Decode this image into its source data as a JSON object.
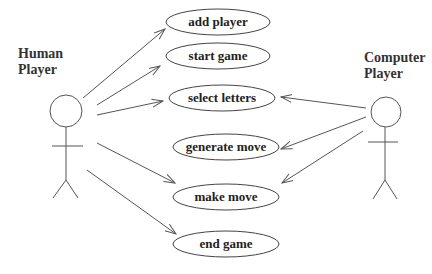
{
  "diagram": {
    "type": "uml-use-case",
    "actors": [
      {
        "id": "human",
        "name_line1": "Human",
        "name_line2": "Player"
      },
      {
        "id": "computer",
        "name_line1": "Computer",
        "name_line2": "Player"
      }
    ],
    "use_cases": [
      {
        "id": "add_player",
        "label": "add player"
      },
      {
        "id": "start_game",
        "label": "start game"
      },
      {
        "id": "select_letters",
        "label": "select letters"
      },
      {
        "id": "generate_move",
        "label": "generate move"
      },
      {
        "id": "make_move",
        "label": "make move"
      },
      {
        "id": "end_game",
        "label": "end game"
      }
    ],
    "associations": [
      {
        "from": "human",
        "to": "add_player"
      },
      {
        "from": "human",
        "to": "start_game"
      },
      {
        "from": "human",
        "to": "select_letters"
      },
      {
        "from": "human",
        "to": "make_move"
      },
      {
        "from": "human",
        "to": "end_game"
      },
      {
        "from": "computer",
        "to": "select_letters"
      },
      {
        "from": "computer",
        "to": "generate_move"
      },
      {
        "from": "computer",
        "to": "make_move"
      }
    ]
  }
}
